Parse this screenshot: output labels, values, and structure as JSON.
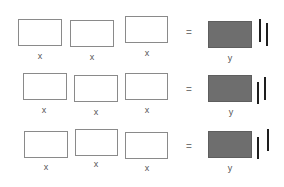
{
  "diagram": {
    "colors": {
      "x_tile_border": "#8a8a8a",
      "y_tile_fill": "#6e6e6e",
      "unit_bar": "#1e1e1e"
    },
    "rows": [
      {
        "x_labels": [
          "x",
          "x",
          "x"
        ],
        "equals": "=",
        "y_label": "y",
        "unit_bars": 2
      },
      {
        "x_labels": [
          "x",
          "x",
          "x"
        ],
        "equals": "=",
        "y_label": "y",
        "unit_bars": 2
      },
      {
        "x_labels": [
          "x",
          "x",
          "x"
        ],
        "equals": "=",
        "y_label": "y",
        "unit_bars": 2
      }
    ]
  }
}
